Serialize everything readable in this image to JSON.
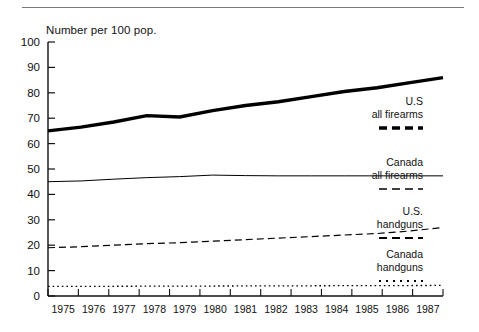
{
  "header": {
    "rule_present": true
  },
  "chart_data": {
    "type": "line",
    "title": "Number per 100 pop.",
    "xlabel": "",
    "ylabel": "Number per 100 pop.",
    "xlim": [
      1975,
      1987
    ],
    "ylim": [
      0,
      100
    ],
    "grid": false,
    "legend_position": "right-inline",
    "x": [
      1975,
      1976,
      1977,
      1978,
      1979,
      1980,
      1981,
      1982,
      1983,
      1984,
      1985,
      1986,
      1987
    ],
    "y_ticks": [
      0,
      10,
      20,
      30,
      40,
      50,
      60,
      70,
      80,
      90,
      100
    ],
    "x_ticks": [
      "1975",
      "1976",
      "1977",
      "1978",
      "1979",
      "1980",
      "1981",
      "1982",
      "1983",
      "1984",
      "1985",
      "1986",
      "1987"
    ],
    "series": [
      {
        "name": "U.S all firearms",
        "label_line1": "U.S",
        "label_line2": "all firearms",
        "style": "thick-solid",
        "swatch": "thick-dash",
        "color": "#000000",
        "width": 3.4,
        "values": [
          65,
          66.5,
          68.5,
          71,
          70.5,
          73,
          75,
          76.5,
          78.5,
          80.5,
          82,
          84,
          86
        ]
      },
      {
        "name": "Canada all firearms",
        "label_line1": "Canada",
        "label_line2": "all firearms",
        "style": "thin-solid",
        "swatch": "thin-dash",
        "color": "#000000",
        "width": 1.0,
        "values": [
          45,
          45.3,
          46,
          46.6,
          47,
          47.6,
          47.4,
          47.3,
          47.3,
          47.3,
          47.3,
          47.3,
          47.3
        ]
      },
      {
        "name": "U.S. handguns",
        "label_line1": "U.S.",
        "label_line2": "handguns",
        "style": "dashed",
        "swatch": "medium-dash",
        "color": "#000000",
        "width": 1.2,
        "values": [
          19,
          19.4,
          20,
          20.6,
          21,
          21.6,
          22.2,
          22.8,
          23.4,
          24,
          24.6,
          25.6,
          27
        ]
      },
      {
        "name": "Canada handguns",
        "label_line1": "Canada",
        "label_line2": "handguns",
        "style": "dotted",
        "swatch": "dotted",
        "color": "#000000",
        "width": 1.4,
        "values": [
          3.8,
          3.8,
          3.8,
          3.9,
          3.9,
          3.9,
          4.0,
          4.0,
          4.0,
          4.1,
          4.1,
          4.1,
          4.2
        ]
      }
    ],
    "legend_entries": [
      {
        "line1": "U.S",
        "line2": "all firearms",
        "swatch": "thick-dash"
      },
      {
        "line1": "Canada",
        "line2": "all firearms",
        "swatch": "thin-dash"
      },
      {
        "line1": "U.S.",
        "line2": "handguns",
        "swatch": "medium-dash"
      },
      {
        "line1": "Canada",
        "line2": "handguns",
        "swatch": "dotted"
      }
    ]
  }
}
